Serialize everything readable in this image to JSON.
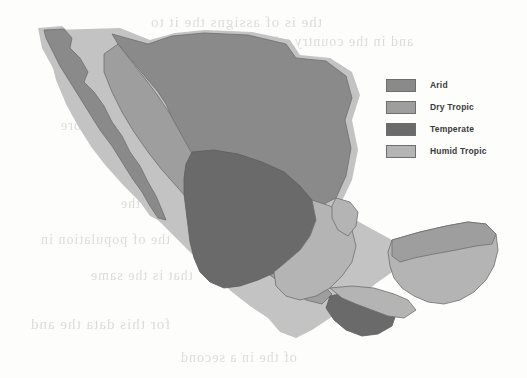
{
  "figure": {
    "kind": "choropleth-map"
  },
  "legend": {
    "items": [
      {
        "label": "Arid",
        "color": "#8a8a8a"
      },
      {
        "label": "Dry Tropic",
        "color": "#9e9e9e"
      },
      {
        "label": "Temperate",
        "color": "#6b6b6b"
      },
      {
        "label": "Humid Tropic",
        "color": "#b4b4b4"
      }
    ]
  },
  "map": {
    "outline_color": "#6f6f6f",
    "background_color": "#fdfdfc",
    "regions": [
      {
        "name": "baja-california-peninsula",
        "zone": "Arid"
      },
      {
        "name": "northern-highlands",
        "zone": "Arid"
      },
      {
        "name": "pacific-coast-band",
        "zone": "Dry Tropic"
      },
      {
        "name": "central-highlands",
        "zone": "Temperate"
      },
      {
        "name": "gulf-coast-lowlands",
        "zone": "Humid Tropic"
      },
      {
        "name": "yucatan-north-coast",
        "zone": "Dry Tropic"
      },
      {
        "name": "yucatan-interior",
        "zone": "Humid Tropic"
      },
      {
        "name": "chiapas-highlands",
        "zone": "Temperate"
      }
    ]
  },
  "scan_artifacts": {
    "note": "faint mirrored show-through text from reverse page",
    "lines": [
      {
        "text": "the  is  of  assigns  the  it  to",
        "x": 150,
        "y": 14,
        "size": 15
      },
      {
        "text": "and  in  the  country  which",
        "x": 250,
        "y": 34,
        "size": 14
      },
      {
        "text": "of  the  region  is  more",
        "x": 60,
        "y": 118,
        "size": 14
      },
      {
        "text": "in  the  area  and  the",
        "x": 120,
        "y": 196,
        "size": 14
      },
      {
        "text": "the  of  population  in",
        "x": 40,
        "y": 232,
        "size": 14
      },
      {
        "text": "that  is  the  same",
        "x": 90,
        "y": 268,
        "size": 14
      },
      {
        "text": "for  this  data  the  and",
        "x": 30,
        "y": 316,
        "size": 15
      },
      {
        "text": "of  the  in  a  second",
        "x": 180,
        "y": 350,
        "size": 14
      }
    ]
  }
}
